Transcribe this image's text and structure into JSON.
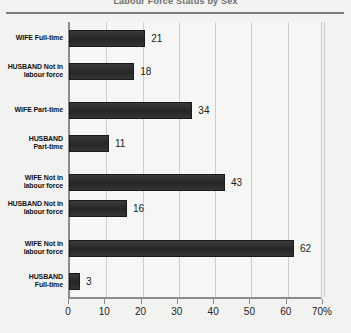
{
  "chart_data": {
    "type": "bar",
    "orientation": "horizontal",
    "title": "Labour Force Status by Sex",
    "categories": [
      "WIFE Full-time",
      "HUSBAND Not in\nlabour force",
      "WIFE Part-time",
      "HUSBAND\nPart-time",
      "WIFE Not in\nlabour force",
      "HUSBAND Not in\nlabour force",
      "WIFE Not in\nlabour force",
      "HUSBAND\nFull-time"
    ],
    "values": [
      21,
      18,
      34,
      11,
      43,
      16,
      62,
      3
    ],
    "xlabel": "",
    "ylabel": "",
    "xlim": [
      0,
      70
    ],
    "xticks": [
      0,
      10,
      20,
      30,
      40,
      50,
      60,
      70
    ],
    "xticklabels": [
      "0",
      "10",
      "20",
      "30",
      "40",
      "50",
      "60",
      "70%"
    ],
    "grid": "vertical",
    "legend": "none",
    "bar_color": "#2f2f2f",
    "plot_background": "#f6f6f4",
    "gridline_color": "#cdcdcd",
    "axis_color": "#8a8a8e"
  }
}
